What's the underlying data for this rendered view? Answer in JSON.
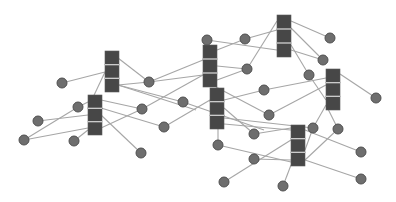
{
  "diagram": {
    "title": "",
    "type": "network-graph",
    "colors": {
      "background": "#ffffff",
      "edge": "#a6a6a6",
      "node_fill": "#6e6e6e",
      "node_stroke": "#505050",
      "stack_fill": "#474747",
      "stack_divider": "#d9d9d9"
    },
    "stacks": [
      {
        "id": "S1",
        "x": 105,
        "y": 51,
        "w": 14,
        "h": 41,
        "segments": 3
      },
      {
        "id": "S2",
        "x": 88,
        "y": 95,
        "w": 14,
        "h": 40,
        "segments": 3
      },
      {
        "id": "S3",
        "x": 203,
        "y": 45,
        "w": 14,
        "h": 42,
        "segments": 3
      },
      {
        "id": "S4",
        "x": 210,
        "y": 88,
        "w": 14,
        "h": 41,
        "segments": 3
      },
      {
        "id": "S5",
        "x": 277,
        "y": 15,
        "w": 14,
        "h": 42,
        "segments": 3
      },
      {
        "id": "S6",
        "x": 326,
        "y": 69,
        "w": 14,
        "h": 41,
        "segments": 3
      },
      {
        "id": "S7",
        "x": 291,
        "y": 125,
        "w": 14,
        "h": 41,
        "segments": 3
      }
    ],
    "nodes": [
      {
        "id": "n1",
        "x": 62,
        "y": 83
      },
      {
        "id": "n2",
        "x": 149,
        "y": 82
      },
      {
        "id": "n3",
        "x": 78,
        "y": 107
      },
      {
        "id": "n4",
        "x": 38,
        "y": 121
      },
      {
        "id": "n5",
        "x": 24,
        "y": 140
      },
      {
        "id": "n6",
        "x": 74,
        "y": 141
      },
      {
        "id": "n7",
        "x": 141,
        "y": 153
      },
      {
        "id": "n8",
        "x": 142,
        "y": 109
      },
      {
        "id": "n9",
        "x": 164,
        "y": 127
      },
      {
        "id": "n10",
        "x": 183,
        "y": 102
      },
      {
        "id": "n11",
        "x": 207,
        "y": 40
      },
      {
        "id": "n12",
        "x": 245,
        "y": 39
      },
      {
        "id": "n13",
        "x": 247,
        "y": 69
      },
      {
        "id": "n14",
        "x": 264,
        "y": 90
      },
      {
        "id": "n15",
        "x": 269,
        "y": 115
      },
      {
        "id": "n16",
        "x": 330,
        "y": 38
      },
      {
        "id": "n17",
        "x": 323,
        "y": 60
      },
      {
        "id": "n18",
        "x": 309,
        "y": 75
      },
      {
        "id": "n19",
        "x": 376,
        "y": 98
      },
      {
        "id": "n20",
        "x": 218,
        "y": 145
      },
      {
        "id": "n21",
        "x": 254,
        "y": 134
      },
      {
        "id": "n22",
        "x": 254,
        "y": 159
      },
      {
        "id": "n23",
        "x": 313,
        "y": 128
      },
      {
        "id": "n24",
        "x": 338,
        "y": 129
      },
      {
        "id": "n25",
        "x": 361,
        "y": 152
      },
      {
        "id": "n26",
        "x": 361,
        "y": 179
      },
      {
        "id": "n27",
        "x": 224,
        "y": 182
      },
      {
        "id": "n28",
        "x": 283,
        "y": 186
      }
    ],
    "edges": [
      [
        62,
        83,
        105,
        72
      ],
      [
        118,
        58,
        149,
        82
      ],
      [
        118,
        85,
        149,
        82
      ],
      [
        118,
        85,
        196,
        110
      ],
      [
        118,
        85,
        183,
        102
      ],
      [
        105,
        72,
        88,
        108
      ],
      [
        149,
        82,
        203,
        60
      ],
      [
        149,
        82,
        203,
        75
      ],
      [
        78,
        107,
        88,
        102
      ],
      [
        78,
        107,
        24,
        140
      ],
      [
        38,
        121,
        88,
        115
      ],
      [
        24,
        140,
        88,
        128
      ],
      [
        74,
        141,
        88,
        130
      ],
      [
        101,
        100,
        142,
        109
      ],
      [
        101,
        108,
        164,
        127
      ],
      [
        101,
        115,
        141,
        153
      ],
      [
        101,
        128,
        142,
        109
      ],
      [
        142,
        109,
        203,
        75
      ],
      [
        164,
        127,
        210,
        100
      ],
      [
        183,
        102,
        264,
        130
      ],
      [
        207,
        40,
        277,
        50
      ],
      [
        217,
        50,
        245,
        39
      ],
      [
        245,
        39,
        277,
        30
      ],
      [
        217,
        80,
        247,
        69
      ],
      [
        247,
        69,
        277,
        21
      ],
      [
        217,
        66,
        247,
        69
      ],
      [
        291,
        21,
        330,
        38
      ],
      [
        291,
        28,
        323,
        60
      ],
      [
        291,
        45,
        309,
        75
      ],
      [
        291,
        50,
        323,
        60
      ],
      [
        309,
        75,
        326,
        100
      ],
      [
        264,
        90,
        326,
        78
      ],
      [
        224,
        100,
        264,
        90
      ],
      [
        216,
        87,
        269,
        115
      ],
      [
        269,
        115,
        326,
        85
      ],
      [
        340,
        74,
        376,
        98
      ],
      [
        326,
        105,
        338,
        129
      ],
      [
        326,
        105,
        313,
        128
      ],
      [
        224,
        118,
        313,
        128
      ],
      [
        224,
        108,
        254,
        134
      ],
      [
        218,
        129,
        218,
        145
      ],
      [
        218,
        145,
        291,
        162
      ],
      [
        254,
        134,
        291,
        128
      ],
      [
        254,
        159,
        291,
        160
      ],
      [
        224,
        182,
        291,
        140
      ],
      [
        283,
        186,
        291,
        165
      ],
      [
        305,
        130,
        361,
        152
      ],
      [
        305,
        160,
        361,
        179
      ],
      [
        305,
        160,
        338,
        129
      ],
      [
        305,
        150,
        313,
        128
      ],
      [
        224,
        124,
        291,
        130
      ]
    ]
  }
}
